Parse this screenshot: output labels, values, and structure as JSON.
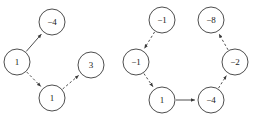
{
  "figure": {
    "title": "",
    "background_color": "#ffffff",
    "node_stroke_color": "#3a3a3a",
    "node_fill_color": "#ffffff",
    "label_color": "#1a1a1a",
    "edge_color": "#3a3a3a",
    "node_radius": 13
  },
  "graphs": [
    {
      "id": "left-graph",
      "name": "left-directed-graph",
      "node_count": 4,
      "edge_count": 3,
      "nodes": [
        {
          "id": "L0",
          "label": "−4",
          "value": -4,
          "cx": 52,
          "cy": 22,
          "r": 13
        },
        {
          "id": "L1",
          "label": "1",
          "value": 1,
          "cx": 17,
          "cy": 62,
          "r": 13
        },
        {
          "id": "L2",
          "label": "3",
          "value": 3,
          "cx": 91,
          "cy": 65,
          "r": 13
        },
        {
          "id": "L3",
          "label": "1",
          "value": 1,
          "cx": 52,
          "cy": 98,
          "r": 13
        }
      ],
      "edges": [
        {
          "id": "LE0",
          "from": "L1",
          "to": "L0",
          "style": "solid",
          "directed": true
        },
        {
          "id": "LE1",
          "from": "L1",
          "to": "L3",
          "style": "dashed",
          "directed": true
        },
        {
          "id": "LE2",
          "from": "L3",
          "to": "L2",
          "style": "dashed",
          "directed": true
        }
      ]
    },
    {
      "id": "right-graph",
      "name": "right-directed-graph",
      "node_count": 6,
      "edge_count": 5,
      "nodes": [
        {
          "id": "R0",
          "label": "−1",
          "value": -1,
          "cx": 162,
          "cy": 20,
          "r": 13
        },
        {
          "id": "R1",
          "label": "−8",
          "value": -8,
          "cx": 211,
          "cy": 20,
          "r": 13
        },
        {
          "id": "R2",
          "label": "−1",
          "value": -1,
          "cx": 136,
          "cy": 62,
          "r": 13
        },
        {
          "id": "R3",
          "label": "−2",
          "value": -2,
          "cx": 235,
          "cy": 62,
          "r": 13
        },
        {
          "id": "R4",
          "label": "1",
          "value": 1,
          "cx": 162,
          "cy": 100,
          "r": 13
        },
        {
          "id": "R5",
          "label": "−4",
          "value": -4,
          "cx": 211,
          "cy": 100,
          "r": 13
        }
      ],
      "edges": [
        {
          "id": "RE0",
          "from": "R0",
          "to": "R2",
          "style": "dashed",
          "directed": true
        },
        {
          "id": "RE1",
          "from": "R2",
          "to": "R4",
          "style": "dashed",
          "directed": true
        },
        {
          "id": "RE2",
          "from": "R4",
          "to": "R5",
          "style": "solid",
          "directed": true
        },
        {
          "id": "RE3",
          "from": "R5",
          "to": "R3",
          "style": "dashed",
          "directed": true
        },
        {
          "id": "RE4",
          "from": "R3",
          "to": "R1",
          "style": "dashed",
          "directed": true
        }
      ]
    }
  ]
}
